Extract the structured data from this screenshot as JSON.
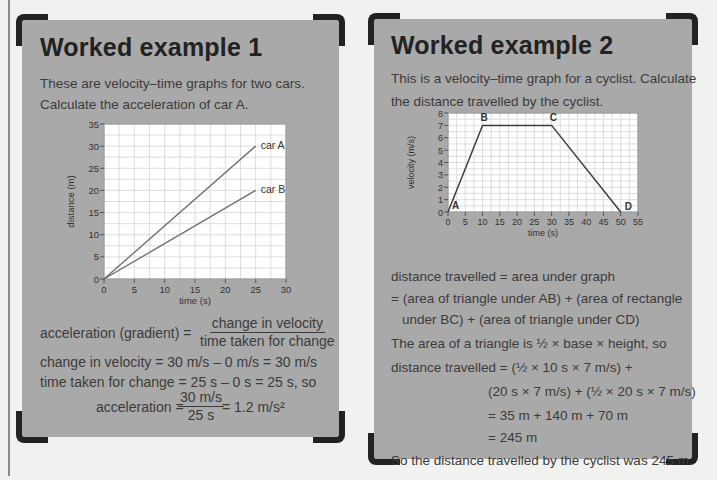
{
  "example1": {
    "title": "Worked example 1",
    "intro_line1": "These are velocity–time graphs for two cars.",
    "intro_line2": "Calculate the acceleration of car A.",
    "formula_label": "acceleration (gradient) =",
    "formula_numerator": "change in velocity",
    "formula_denominator": "time taken for change",
    "step1": "change in velocity = 30 m/s – 0 m/s = 30 m/s",
    "step2": "time taken for change = 25 s – 0 s = 25 s, so",
    "result_label": "acceleration =",
    "result_numerator": "30 m/s",
    "result_denominator": "25 s",
    "result_value": "= 1.2 m/s²"
  },
  "example2": {
    "title": "Worked example 2",
    "intro_line1": "This is a velocity–time graph for a cyclist. Calculate",
    "intro_line2": "the distance travelled by the cyclist.",
    "lines": [
      "distance travelled = area under graph",
      "= (area of triangle under AB) + (area of rectangle",
      "under BC) + (area of triangle under CD)",
      "The area of a triangle is ½ × base × height, so",
      "distance travelled = (½ × 10 s × 7 m/s) +",
      "(20 s × 7 m/s) + (½ × 20 s × 7 m/s)",
      "= 35 m + 140 m + 70 m",
      "= 245 m",
      "So the distance travelled by the cyclist was 245 m."
    ]
  },
  "colors": {
    "card_bg": "#a9a9a9",
    "page_bg": "#f1f1ef",
    "corner": "#222222",
    "plot_bg": "#ffffff",
    "grid": "#d6d6d6",
    "line": "#6a6a6a"
  },
  "chart_data": [
    {
      "type": "line",
      "title": "",
      "xlabel": "time (s)",
      "ylabel": "distance (m)",
      "xlim": [
        0,
        30
      ],
      "ylim": [
        0,
        35
      ],
      "x_ticks": [
        "0",
        "5",
        "10",
        "15",
        "20",
        "25",
        "30"
      ],
      "y_ticks": [
        "0",
        "5",
        "10",
        "15",
        "20",
        "25",
        "30",
        "35"
      ],
      "grid": true,
      "series": [
        {
          "name": "car A",
          "x": [
            0,
            25
          ],
          "values": [
            0,
            30
          ]
        },
        {
          "name": "car B",
          "x": [
            0,
            25
          ],
          "values": [
            0,
            20
          ]
        }
      ]
    },
    {
      "type": "line",
      "title": "",
      "xlabel": "time (s)",
      "ylabel": "velocity (m/s)",
      "xlim": [
        0,
        55
      ],
      "ylim": [
        0,
        8
      ],
      "x_ticks": [
        "0",
        "5",
        "10",
        "15",
        "20",
        "25",
        "30",
        "35",
        "40",
        "45",
        "50",
        "55"
      ],
      "y_ticks": [
        "0",
        "1",
        "2",
        "3",
        "4",
        "5",
        "6",
        "7",
        "8"
      ],
      "grid": true,
      "series": [
        {
          "name": "cyclist",
          "x": [
            0,
            10,
            30,
            50
          ],
          "values": [
            0,
            7,
            7,
            0
          ],
          "point_labels": [
            "A",
            "B",
            "C",
            "D"
          ]
        }
      ]
    }
  ]
}
